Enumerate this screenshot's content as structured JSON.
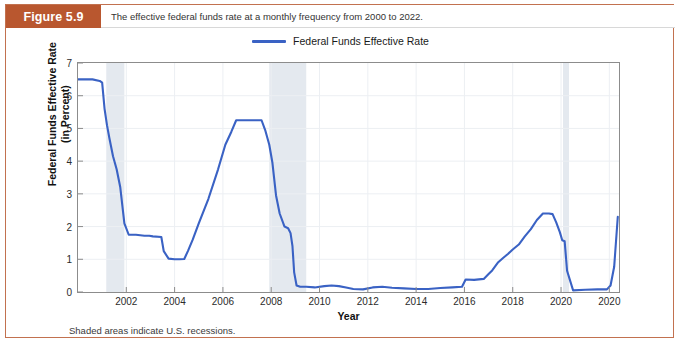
{
  "figure": {
    "badge_label": "Figure 5.9",
    "caption": "The effective federal funds rate at a monthly frequency from 2000 to 2022.",
    "note": "Shaded areas indicate U.S. recessions.",
    "border_color": "#c2714f",
    "badge_color": "#b9572f"
  },
  "legend": {
    "position": "top-center",
    "entries": [
      {
        "label": "Federal Funds Effective Rate",
        "color": "#3a62c4"
      }
    ]
  },
  "chart_data": {
    "type": "line",
    "title": "",
    "xlabel": "Year",
    "ylabel": "Federal Funds Effective Rate (in Percent)",
    "ylabel_line1": "Federal Funds Effective Rate",
    "ylabel_line2": "(in Percent)",
    "xlim": [
      2000.0,
      2022.4
    ],
    "ylim": [
      0,
      7
    ],
    "grid": true,
    "y_ticks": [
      0,
      1,
      2,
      3,
      4,
      5,
      6,
      7
    ],
    "y_tick_labels": [
      "0",
      "1",
      "2",
      "3",
      "4",
      "5",
      "6",
      "7"
    ],
    "x_ticks": [
      2002,
      2004,
      2006,
      2008,
      2010,
      2012,
      2014,
      2016,
      2018,
      2020,
      2022
    ],
    "x_tick_labels": [
      "2002",
      "2004",
      "2006",
      "2008",
      "2010",
      "2012",
      "2014",
      "2016",
      "2018",
      "2020",
      "2020"
    ],
    "line_color": "#3a62c4",
    "line_width": 2.1,
    "shaded_regions": [
      {
        "label": "2001 recession",
        "x0": 2001.17,
        "x1": 2001.92,
        "color": "#e4e9ef"
      },
      {
        "label": "2008-2009 recession",
        "x0": 2007.92,
        "x1": 2009.45,
        "color": "#e4e9ef"
      },
      {
        "label": "2020 recession",
        "x0": 2020.08,
        "x1": 2020.33,
        "color": "#e4e9ef"
      }
    ],
    "series": [
      {
        "name": "Federal Funds Effective Rate",
        "x": [
          2000.0,
          2000.3,
          2000.6,
          2000.9,
          2001.0,
          2001.1,
          2001.2,
          2001.3,
          2001.45,
          2001.6,
          2001.75,
          2001.92,
          2002.1,
          2002.4,
          2002.75,
          2002.95,
          2003.1,
          2003.45,
          2003.55,
          2003.75,
          2004.0,
          2004.2,
          2004.4,
          2004.55,
          2004.75,
          2005.0,
          2005.4,
          2005.8,
          2006.1,
          2006.35,
          2006.55,
          2006.8,
          2007.2,
          2007.6,
          2007.75,
          2007.92,
          2008.05,
          2008.2,
          2008.35,
          2008.55,
          2008.7,
          2008.8,
          2008.88,
          2008.95,
          2009.05,
          2009.2,
          2009.45,
          2009.8,
          2010.2,
          2010.5,
          2010.8,
          2011.1,
          2011.4,
          2011.8,
          2012.2,
          2012.6,
          2013.0,
          2013.5,
          2014.0,
          2014.5,
          2015.0,
          2015.5,
          2015.9,
          2016.05,
          2016.4,
          2016.8,
          2017.0,
          2017.15,
          2017.4,
          2017.6,
          2017.8,
          2018.0,
          2018.25,
          2018.5,
          2018.75,
          2019.0,
          2019.25,
          2019.5,
          2019.65,
          2019.8,
          2019.95,
          2020.05,
          2020.15,
          2020.25,
          2020.5,
          2021.0,
          2021.5,
          2021.9,
          2022.05,
          2022.2,
          2022.35
        ],
        "y": [
          6.5,
          6.5,
          6.5,
          6.45,
          6.4,
          5.6,
          5.1,
          4.7,
          4.15,
          3.75,
          3.2,
          2.1,
          1.75,
          1.75,
          1.72,
          1.72,
          1.7,
          1.68,
          1.25,
          1.02,
          1.0,
          1.0,
          1.01,
          1.25,
          1.6,
          2.1,
          2.85,
          3.75,
          4.5,
          4.9,
          5.25,
          5.25,
          5.25,
          5.25,
          4.95,
          4.5,
          3.95,
          2.95,
          2.4,
          2.0,
          1.95,
          1.8,
          1.4,
          0.6,
          0.2,
          0.16,
          0.16,
          0.14,
          0.18,
          0.2,
          0.18,
          0.14,
          0.09,
          0.08,
          0.14,
          0.16,
          0.13,
          0.11,
          0.09,
          0.09,
          0.12,
          0.14,
          0.16,
          0.38,
          0.37,
          0.4,
          0.55,
          0.66,
          0.91,
          1.04,
          1.16,
          1.3,
          1.45,
          1.7,
          1.92,
          2.2,
          2.4,
          2.4,
          2.38,
          2.13,
          1.83,
          1.58,
          1.55,
          0.65,
          0.05,
          0.07,
          0.08,
          0.08,
          0.2,
          0.77,
          2.3
        ]
      }
    ]
  }
}
